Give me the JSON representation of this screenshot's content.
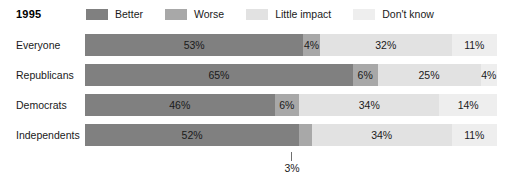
{
  "header": {
    "year_title": "1995"
  },
  "legend": {
    "items": [
      {
        "label": "Better",
        "color": "#808080"
      },
      {
        "label": "Worse",
        "color": "#a8a8a8"
      },
      {
        "label": "Little impact",
        "color": "#e2e2e2"
      },
      {
        "label": "Don't know",
        "color": "#eeeeee"
      }
    ]
  },
  "callout": {
    "value_label": "3%"
  },
  "chart_data": {
    "type": "bar",
    "title": "1995",
    "orientation": "horizontal",
    "stacked": true,
    "normalized_percent": true,
    "xlabel": "",
    "ylabel": "",
    "xlim": [
      0,
      100
    ],
    "grid": false,
    "legend_position": "top",
    "categories": [
      "Everyone",
      "Republicans",
      "Democrats",
      "Independents"
    ],
    "series": [
      {
        "name": "Better",
        "color": "#808080",
        "values": [
          53,
          65,
          46,
          52
        ]
      },
      {
        "name": "Worse",
        "color": "#a8a8a8",
        "values": [
          4,
          6,
          6,
          3
        ]
      },
      {
        "name": "Little impact",
        "color": "#e2e2e2",
        "values": [
          32,
          25,
          34,
          34
        ]
      },
      {
        "name": "Don't know",
        "color": "#eeeeee",
        "values": [
          11,
          4,
          14,
          11
        ]
      }
    ],
    "rows": [
      {
        "label": "Everyone",
        "segments": [
          {
            "name": "Better",
            "value": 53,
            "text": "53%",
            "color": "#808080",
            "label_shown": true
          },
          {
            "name": "Worse",
            "value": 4,
            "text": "4%",
            "color": "#a8a8a8",
            "label_shown": true
          },
          {
            "name": "Little impact",
            "value": 32,
            "text": "32%",
            "color": "#e2e2e2",
            "label_shown": true
          },
          {
            "name": "Don't know",
            "value": 11,
            "text": "11%",
            "color": "#eeeeee",
            "label_shown": true
          }
        ]
      },
      {
        "label": "Republicans",
        "segments": [
          {
            "name": "Better",
            "value": 65,
            "text": "65%",
            "color": "#808080",
            "label_shown": true
          },
          {
            "name": "Worse",
            "value": 6,
            "text": "6%",
            "color": "#a8a8a8",
            "label_shown": true
          },
          {
            "name": "Little impact",
            "value": 25,
            "text": "25%",
            "color": "#e2e2e2",
            "label_shown": true
          },
          {
            "name": "Don't know",
            "value": 4,
            "text": "4%",
            "color": "#eeeeee",
            "label_shown": true
          }
        ]
      },
      {
        "label": "Democrats",
        "segments": [
          {
            "name": "Better",
            "value": 46,
            "text": "46%",
            "color": "#808080",
            "label_shown": true
          },
          {
            "name": "Worse",
            "value": 6,
            "text": "6%",
            "color": "#a8a8a8",
            "label_shown": true
          },
          {
            "name": "Little impact",
            "value": 34,
            "text": "34%",
            "color": "#e2e2e2",
            "label_shown": true
          },
          {
            "name": "Don't know",
            "value": 14,
            "text": "14%",
            "color": "#eeeeee",
            "label_shown": true
          }
        ]
      },
      {
        "label": "Independents",
        "segments": [
          {
            "name": "Better",
            "value": 52,
            "text": "52%",
            "color": "#808080",
            "label_shown": true
          },
          {
            "name": "Worse",
            "value": 3,
            "text": "3%",
            "color": "#a8a8a8",
            "label_shown": false
          },
          {
            "name": "Little impact",
            "value": 34,
            "text": "34%",
            "color": "#e2e2e2",
            "label_shown": true
          },
          {
            "name": "Don't know",
            "value": 11,
            "text": "11%",
            "color": "#eeeeee",
            "label_shown": true
          }
        ]
      }
    ],
    "annotations": [
      {
        "text": "3%",
        "target_row": "Independents",
        "target_series": "Worse"
      }
    ]
  }
}
